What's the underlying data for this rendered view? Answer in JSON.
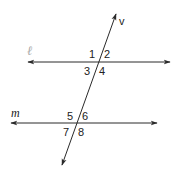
{
  "diagram": {
    "lines": {
      "l": {
        "label": "ℓ",
        "y": 62,
        "x1": 28,
        "x2": 170
      },
      "m": {
        "label": "m",
        "y": 123,
        "x1": 11,
        "x2": 157
      },
      "v": {
        "label": "v",
        "x1": 116,
        "y1": 14,
        "x2": 62,
        "y2": 165
      }
    },
    "angles": {
      "a1": "1",
      "a2": "2",
      "a3": "3",
      "a4": "4",
      "a5": "5",
      "a6": "6",
      "a7": "7",
      "a8": "8"
    },
    "colors": {
      "stroke": "#2a2a2a",
      "text": "#222222",
      "faint_label": "#aaaaaa"
    }
  }
}
